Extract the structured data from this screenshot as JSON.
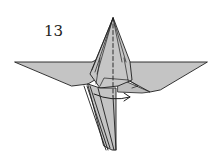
{
  "diagram": {
    "step_number": "13",
    "colors": {
      "paper": "#c4c4c4",
      "line": "#1e1e1e",
      "background": "#ffffff"
    },
    "elements": {
      "valley_fold_line": "dashed vertical line (fold)",
      "arrow": "curved arrow pointing right (turn/fold flap)"
    }
  }
}
